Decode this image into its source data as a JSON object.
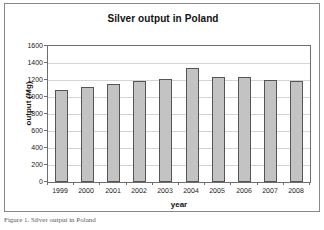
{
  "figure": {
    "caption": "Figure 1. Silver output in Poland"
  },
  "chart_data": {
    "type": "bar",
    "title": "Silver output in Poland",
    "xlabel": "year",
    "ylabel": "output (Mg)",
    "categories": [
      "1999",
      "2000",
      "2001",
      "2002",
      "2003",
      "2004",
      "2005",
      "2006",
      "2007",
      "2008"
    ],
    "values": [
      1085,
      1115,
      1150,
      1190,
      1215,
      1345,
      1235,
      1235,
      1205,
      1190
    ],
    "ylim": [
      0,
      1600
    ],
    "ytick_labels": [
      "0",
      "200",
      "400",
      "600",
      "800",
      "1000",
      "1200",
      "1400",
      "1600"
    ],
    "ytick_values": [
      0,
      200,
      400,
      600,
      800,
      1000,
      1200,
      1400,
      1600
    ],
    "grid": true,
    "legend": "none",
    "bar_fill_color": "#c3c3c3",
    "bar_edge_color": "#555555",
    "gridline_color": "#d4d4d4",
    "axis_color": "#6e6e6e",
    "background_color": "#ffffff"
  }
}
